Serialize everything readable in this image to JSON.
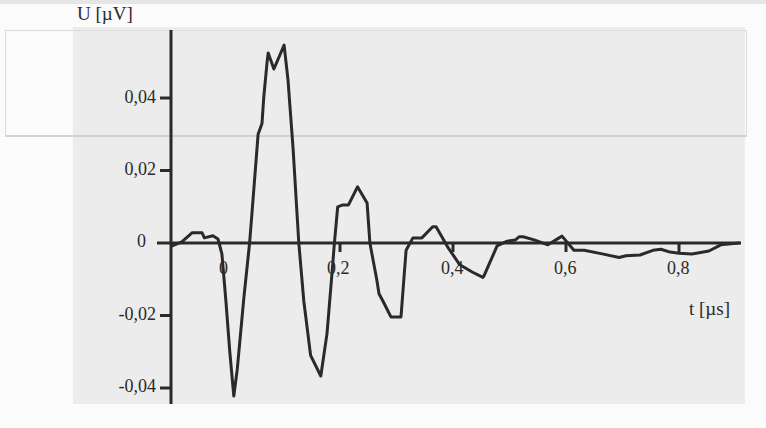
{
  "chart_data": {
    "type": "line",
    "title": "",
    "xlabel": "t [µs]",
    "ylabel": "U [µV]",
    "x_ticks": [
      "0",
      "0,2",
      "0,4",
      "0,6",
      "0,8"
    ],
    "x_tick_values": [
      0,
      0.2,
      0.4,
      0.6,
      0.8
    ],
    "y_ticks": [
      "0,04",
      "0,02",
      "0",
      "-0,02",
      "-0,04"
    ],
    "y_tick_values": [
      0.04,
      0.02,
      0,
      -0.02,
      -0.04
    ],
    "xlim": [
      -0.1,
      0.91
    ],
    "ylim": [
      -0.045,
      0.055
    ],
    "grid": false,
    "legend": null,
    "series": [
      {
        "name": "U(t)",
        "color": "#2a2a2a",
        "x": [
          -0.097,
          -0.08,
          -0.062,
          -0.044,
          -0.04,
          -0.025,
          -0.016,
          -0.009,
          -0.002,
          0.005,
          0.012,
          0.018,
          0.03,
          0.04,
          0.044,
          0.055,
          0.062,
          0.065,
          0.071,
          0.073,
          0.083,
          0.101,
          0.108,
          0.117,
          0.127,
          0.136,
          0.148,
          0.166,
          0.177,
          0.186,
          0.19,
          0.196,
          0.205,
          0.215,
          0.231,
          0.248,
          0.253,
          0.265,
          0.269,
          0.276,
          0.29,
          0.308,
          0.312,
          0.317,
          0.329,
          0.345,
          0.364,
          0.37,
          0.39,
          0.412,
          0.434,
          0.453,
          0.455,
          0.478,
          0.496,
          0.51,
          0.517,
          0.524,
          0.545,
          0.568,
          0.593,
          0.614,
          0.632,
          0.664,
          0.694,
          0.706,
          0.731,
          0.754,
          0.768,
          0.784,
          0.8,
          0.823,
          0.853,
          0.874,
          0.906
        ],
        "y": [
          -0.0008,
          0.0003,
          0.0028,
          0.0028,
          0.0014,
          0.002,
          0.0011,
          -0.003,
          -0.016,
          -0.03,
          -0.0422,
          -0.035,
          -0.015,
          0,
          0.008,
          0.03,
          0.033,
          0.04,
          0.05,
          0.0524,
          0.048,
          0.0546,
          0.045,
          0.026,
          0,
          -0.016,
          -0.031,
          -0.0367,
          -0.025,
          -0.008,
          0,
          0.01,
          0.0105,
          0.0105,
          0.0155,
          0.011,
          0,
          -0.01,
          -0.014,
          -0.016,
          -0.0204,
          -0.0204,
          -0.012,
          -0.002,
          0.0014,
          0.0014,
          0.0045,
          0.0045,
          -0.001,
          -0.006,
          -0.008,
          -0.0095,
          -0.009,
          -0.0008,
          0.0005,
          0.0008,
          0.0017,
          0.0017,
          0.0008,
          -0.0005,
          0.0019,
          -0.002,
          -0.002,
          -0.003,
          -0.004,
          -0.0035,
          -0.0033,
          -0.002,
          -0.0017,
          -0.0025,
          -0.0028,
          -0.003,
          -0.0022,
          -0.0005,
          0
        ]
      }
    ]
  },
  "axes": {
    "y_title": "U [µV]",
    "x_title": "t [µs]",
    "y_tick_labels": [
      "0,04",
      "0,02",
      "0",
      "-0,02",
      "-0,04"
    ],
    "x_tick_labels": [
      "0",
      "0,2",
      "0,4",
      "0,6",
      "0,8"
    ]
  }
}
